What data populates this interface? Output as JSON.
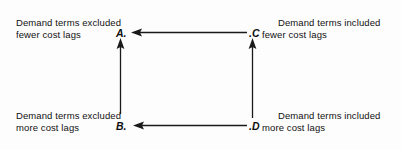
{
  "diagram": {
    "type": "node-arrow-diagram",
    "background_color": "#fdfdfd",
    "line_color": "#1a1a1a",
    "text_color": "#111111",
    "nodes": [
      {
        "id": "A",
        "marker": "A.",
        "position": "top-left",
        "label_lines": [
          "Demand terms excluded",
          "fewer cost lags"
        ]
      },
      {
        "id": "B",
        "marker": "B.",
        "position": "bottom-left",
        "label_lines": [
          "Demand terms excluded",
          "more cost lags"
        ]
      },
      {
        "id": "C",
        "marker": ".C",
        "position": "top-right",
        "label_lines": [
          "Demand terms included",
          "fewer cost lags"
        ]
      },
      {
        "id": "D",
        "marker": ".D",
        "position": "bottom-right",
        "label_lines": [
          "Demand terms included",
          "more cost lags"
        ]
      }
    ],
    "arrows": [
      {
        "id": "c-to-a",
        "from": "C",
        "to": "A",
        "orientation": "horizontal",
        "direction": "left"
      },
      {
        "id": "d-to-b",
        "from": "D",
        "to": "B",
        "orientation": "horizontal",
        "direction": "left"
      },
      {
        "id": "b-to-a",
        "from": "B",
        "to": "A",
        "orientation": "vertical",
        "direction": "up"
      },
      {
        "id": "d-to-c",
        "from": "D",
        "to": "C",
        "orientation": "vertical",
        "direction": "up"
      }
    ]
  }
}
